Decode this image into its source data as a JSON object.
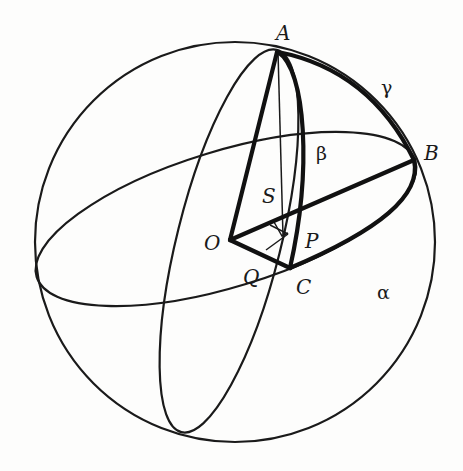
{
  "figure": {
    "colors": {
      "ink": "#1a1a1a",
      "paper": "#fdfdfc"
    },
    "points": {
      "A": {
        "label": "A"
      },
      "B": {
        "label": "B"
      },
      "C": {
        "label": "C"
      },
      "O": {
        "label": "O"
      },
      "P": {
        "label": "P"
      },
      "Q": {
        "label": "Q"
      },
      "S": {
        "label": "S"
      }
    },
    "arcs": {
      "alpha": {
        "label": "α",
        "from": "B",
        "to": "C"
      },
      "beta": {
        "label": "β",
        "from": "A",
        "to": "C"
      },
      "gamma": {
        "label": "γ",
        "from": "A",
        "to": "B"
      }
    },
    "elements": [
      "sphere outline",
      "equatorial great circle",
      "meridian great circle through A",
      "radii OA, OB, OC",
      "perpendicular AP and construction lines with right-angle markers"
    ]
  }
}
